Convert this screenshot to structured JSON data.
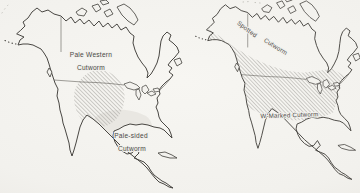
{
  "figure": {
    "kind": "species distribution maps",
    "region_shown": "North America",
    "panel_count": 2
  },
  "left_map": {
    "pale_western_label": {
      "line1": "Pale Western",
      "line2": "Cutworm"
    },
    "pale_sided_label": {
      "line1": "Pale-sided",
      "line2": "Cutworm"
    }
  },
  "right_map": {
    "spotted_label": {
      "word1": "Spotted",
      "word2": "Cutworm"
    },
    "w_marked_label": "W-Marked Cutworm"
  },
  "colors": {
    "paper": "#f2f1ed",
    "ink": "#3f3d39",
    "hatch_line": "#a7a6a1",
    "light_shade": "#e9e7e2",
    "label_text": "#4b4945"
  }
}
